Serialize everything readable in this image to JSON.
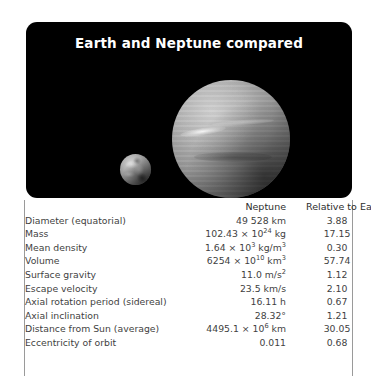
{
  "figure": {
    "title": "Earth and Neptune compared",
    "images": [
      {
        "name": "neptune-planet",
        "label": "Neptune"
      },
      {
        "name": "earth-planet",
        "label": "Earth"
      }
    ],
    "background_color": "#000000",
    "title_color": "#ffffff"
  },
  "table": {
    "headers": [
      "",
      "Neptune",
      "Relative to Earth"
    ],
    "rows": [
      {
        "label": "Diameter (equatorial)",
        "neptune": "49 528 km",
        "relative": "3.88"
      },
      {
        "label": "Mass",
        "neptune": "102.43 × 10",
        "neptune_exp": "24",
        "neptune_unit": " kg",
        "relative": "17.15"
      },
      {
        "label": "Mean density",
        "neptune": "1.64 × 10",
        "neptune_exp": "3",
        "neptune_unit": " kg/m",
        "neptune_unit_exp": "3",
        "relative": "0.30"
      },
      {
        "label": "Volume",
        "neptune": "6254 × 10",
        "neptune_exp": "10",
        "neptune_unit": " km",
        "neptune_unit_exp": "3",
        "relative": "57.74"
      },
      {
        "label": "Surface gravity",
        "neptune": "11.0 m/s",
        "neptune_unit_exp": "2",
        "relative": "1.12"
      },
      {
        "label": "Escape velocity",
        "neptune": "23.5 km/s",
        "relative": "2.10"
      },
      {
        "label": "Axial rotation period (sidereal)",
        "neptune": "16.11 h",
        "relative": "0.67"
      },
      {
        "label": "Axial inclination",
        "neptune": "28.32°",
        "relative": "1.21"
      },
      {
        "label": "Distance from Sun (average)",
        "neptune": "4495.1 × 10",
        "neptune_exp": "6",
        "neptune_unit": " km",
        "relative": "30.05"
      },
      {
        "label": "Eccentricity of orbit",
        "neptune": "0.011",
        "relative": "0.68"
      }
    ],
    "border_color": "#9a9a9a",
    "text_color": "#3f3f3f"
  }
}
